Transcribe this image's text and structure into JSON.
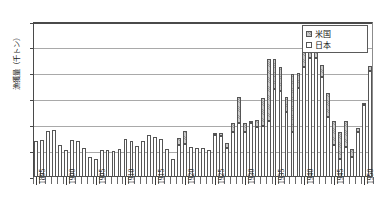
{
  "chart_data": {
    "type": "bar",
    "stacked": true,
    "title": "",
    "xlabel": "",
    "ylabel": "漁獲量（千トン）",
    "ylim": [
      0,
      60
    ],
    "ytick_values": [
      0,
      10,
      20,
      30,
      40,
      50,
      60
    ],
    "ytick_labels": [
      "0",
      "10",
      "20",
      "30",
      "40",
      "50",
      "60"
    ],
    "grid": true,
    "grid_axis": "y",
    "legend_position": "top-right",
    "legend": [
      "米国",
      "日本"
    ],
    "xtick_labels": [
      "1895",
      "1900",
      "1905",
      "1910",
      "1915",
      "1920",
      "1925",
      "1930",
      "1935",
      "1940",
      "1945",
      "1950"
    ],
    "xtick_years": [
      1895,
      1900,
      1905,
      1910,
      1915,
      1920,
      1925,
      1930,
      1935,
      1940,
      1945,
      1950
    ],
    "categories": [
      1895,
      1896,
      1897,
      1898,
      1899,
      1900,
      1901,
      1902,
      1903,
      1904,
      1905,
      1906,
      1907,
      1908,
      1909,
      1910,
      1911,
      1912,
      1913,
      1914,
      1915,
      1916,
      1917,
      1918,
      1919,
      1920,
      1921,
      1922,
      1923,
      1924,
      1925,
      1926,
      1927,
      1928,
      1929,
      1930,
      1931,
      1932,
      1933,
      1934,
      1935,
      1936,
      1937,
      1938,
      1939,
      1940,
      1941,
      1942,
      1943,
      1944,
      1945,
      1946,
      1947,
      1948,
      1949,
      1950,
      1951
    ],
    "series": [
      {
        "name": "日本",
        "color": "#ffffff",
        "values": [
          14.1,
          14.2,
          17.9,
          18.3,
          12.5,
          10.4,
          14.3,
          13.8,
          11.1,
          7.9,
          7.1,
          10.4,
          10.4,
          10.2,
          10.8,
          14.8,
          13.8,
          11.9,
          14.0,
          16.2,
          15.4,
          14.7,
          11.0,
          6.8,
          12.3,
          12.8,
          11.8,
          11.4,
          11.3,
          10.3,
          16.2,
          16.0,
          11.2,
          17.6,
          20.9,
          17.4,
          20.8,
          19.5,
          19.6,
          21.6,
          33.9,
          33.4,
          25.0,
          17.3,
          34.4,
          42.7,
          46.1,
          45.9,
          38.6,
          23.2,
          12.3,
          7.0,
          11.6,
          7.6,
          17.5,
          27.8,
          41.2
        ]
      },
      {
        "name": "米国",
        "color": "#c8c8c8",
        "values": [
          0.0,
          0.0,
          0.0,
          0.0,
          0.0,
          0.0,
          0.0,
          0.0,
          0.0,
          0.0,
          0.0,
          0.0,
          0.0,
          0.0,
          0.0,
          0.0,
          0.0,
          0.0,
          0.0,
          0.0,
          0.0,
          0.0,
          0.0,
          0.0,
          2.7,
          4.9,
          0.0,
          0.0,
          0.0,
          0.0,
          0.5,
          0.9,
          2.0,
          3.4,
          10.0,
          3.5,
          0.5,
          2.4,
          11.1,
          24.0,
          11.7,
          9.1,
          6.0,
          22.7,
          5.7,
          9.6,
          4.5,
          5.5,
          4.8,
          9.4,
          9.5,
          10.5,
          9.9,
          3.3,
          1.5,
          0.3,
          1.9
        ]
      }
    ]
  }
}
